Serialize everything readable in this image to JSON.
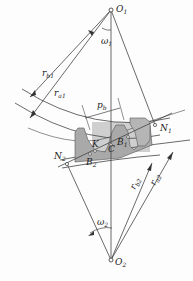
{
  "diagram": {
    "type": "gear-meshing",
    "labels": {
      "O1": "O",
      "O1_sub": "1",
      "O2": "O",
      "O2_sub": "2",
      "omega1": "ω",
      "omega1_sub": "1",
      "omega2": "ω",
      "omega2_sub": "2",
      "rb1": "r",
      "rb1_sub": "b1",
      "ra1": "r",
      "ra1_sub": "a1",
      "rb2": "r",
      "rb2_sub": "b2",
      "ra2": "r",
      "ra2_sub": "a2",
      "pb": "p",
      "pb_sub": "b",
      "N1": "N",
      "N1_sub": "1",
      "N2": "N",
      "N2_sub": "2",
      "K": "K",
      "C": "C",
      "B1": "B",
      "B1_sub": "1",
      "B2": "B",
      "B2_sub": "2"
    },
    "colors": {
      "line": "#444444",
      "gear_fill": "#a9a9a9",
      "shade": "#c8c8c8"
    }
  }
}
